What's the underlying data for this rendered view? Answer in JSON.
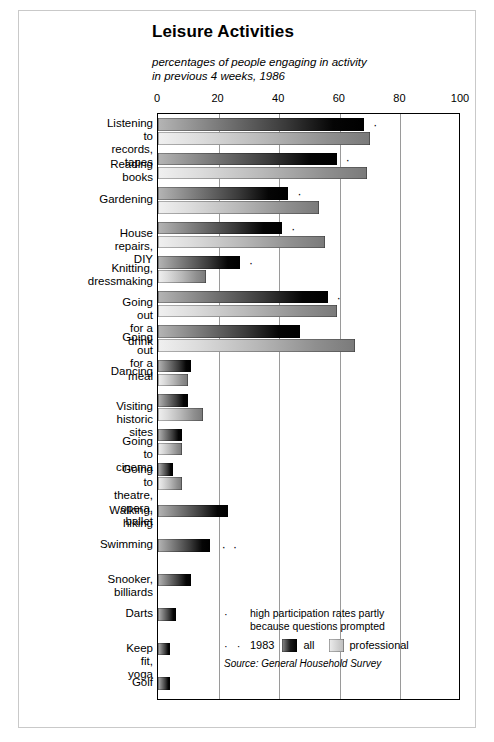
{
  "header": {
    "title": "Leisure Activities",
    "subtitle": "percentages of people engaging in activity\nin previous 4 weeks, 1986"
  },
  "legend": {
    "note_marker": "·",
    "note_text": "high participation rates partly\nbecause questions prompted",
    "year_marker": "· ·",
    "year_label": "1983",
    "series_all_label": "all",
    "series_prof_label": "professional",
    "source": "Source: General Household Survey"
  },
  "chart_data": {
    "type": "bar",
    "orientation": "horizontal",
    "title": "Leisure Activities",
    "subtitle": "percentages of people engaging in activity in previous 4 weeks, 1986",
    "xlabel": "",
    "ylabel": "",
    "xlim": [
      0,
      100
    ],
    "xticks": [
      0,
      20,
      40,
      60,
      80,
      100
    ],
    "grid": true,
    "legend_position": "bottom-right",
    "categories": [
      "Listening to records,\ntapes",
      "Reading books",
      "Gardening",
      "House repairs, DIY",
      "Knitting, dressmaking",
      "Going out for a drink",
      "Going out for a meal",
      "Dancing",
      "Visiting historic sites",
      "Going to cinema",
      "Going to theatre,\nopera, ballet",
      "Walking, hiking",
      "Swimming",
      "Snooker, billiards",
      "Darts",
      "Keep fit, yoga",
      "Golf"
    ],
    "series": [
      {
        "name": "all",
        "values": [
          68,
          59,
          43,
          41,
          27,
          56,
          47,
          11,
          10,
          8,
          5,
          23,
          17,
          11,
          6,
          4,
          4
        ]
      },
      {
        "name": "professional",
        "values": [
          70,
          69,
          53,
          55,
          16,
          59,
          65,
          10,
          15,
          8,
          8,
          null,
          null,
          null,
          null,
          null,
          null
        ]
      }
    ],
    "annotations": [
      {
        "category": "Listening to records,\ntapes",
        "marker": "·",
        "x": 71
      },
      {
        "category": "Reading books",
        "marker": "·",
        "x": 62
      },
      {
        "category": "Gardening",
        "marker": "·",
        "x": 46
      },
      {
        "category": "House repairs, DIY",
        "marker": "·",
        "x": 44
      },
      {
        "category": "Knitting, dressmaking",
        "marker": "·",
        "x": 30
      },
      {
        "category": "Going out for a drink",
        "marker": "·",
        "x": 59
      },
      {
        "category": "Swimming",
        "marker": "· ·",
        "x": 21
      }
    ]
  },
  "axis": {
    "ticks": [
      "0",
      "20",
      "40",
      "60",
      "80",
      "100"
    ]
  }
}
